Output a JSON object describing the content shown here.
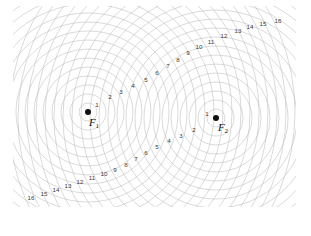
{
  "figure": {
    "background_color": "#ffffff",
    "curve_color": "#b9b9b9",
    "curve_width": 0.55,
    "label_color": "#3a3a3a",
    "dot_color": "#111111",
    "width": 311,
    "height": 236
  },
  "foci": [
    {
      "id": "F1",
      "label": "F",
      "subscript": "1",
      "x": 88,
      "y": 112,
      "ring_label": "1",
      "ring_label_x": 97,
      "ring_label_y": 105,
      "text_x": 94,
      "text_y": 122
    },
    {
      "id": "F2",
      "label": "F",
      "subscript": "2",
      "x": 216,
      "y": 118,
      "ring_label": "1",
      "ring_label_x": 207,
      "ring_label_y": 114,
      "text_x": 223,
      "text_y": 127
    }
  ],
  "circle_family_1": {
    "center_x": 88,
    "center_y": 112,
    "radii": [
      9,
      18,
      27,
      36,
      45,
      54,
      63,
      72,
      81,
      90,
      99,
      108,
      117,
      126,
      135,
      144,
      153,
      162,
      171,
      180,
      189,
      198,
      207
    ]
  },
  "circle_family_2": {
    "center_x": 216,
    "center_y": 118,
    "radii": [
      9,
      18,
      27,
      36,
      45,
      54,
      63,
      72,
      81,
      90,
      99,
      108,
      117,
      126,
      135,
      144,
      153,
      162,
      171,
      180,
      189,
      198,
      207
    ]
  },
  "upper_branch_labels": [
    {
      "text": "2",
      "x": 110,
      "y": 97
    },
    {
      "text": "3",
      "x": 121,
      "y": 92
    },
    {
      "text": "4",
      "x": 133,
      "y": 86
    },
    {
      "text": "5",
      "x": 146,
      "y": 80
    },
    {
      "text": "6",
      "x": 157,
      "y": 73
    },
    {
      "text": "7",
      "x": 168,
      "y": 66
    },
    {
      "text": "8",
      "x": 178,
      "y": 60
    },
    {
      "text": "9",
      "x": 188,
      "y": 53
    },
    {
      "text": "10",
      "x": 199,
      "y": 47
    },
    {
      "text": "11",
      "x": 211,
      "y": 42
    },
    {
      "text": "12",
      "x": 224,
      "y": 36
    },
    {
      "text": "13",
      "x": 238,
      "y": 31
    },
    {
      "text": "14",
      "x": 250,
      "y": 27
    },
    {
      "text": "15",
      "x": 263,
      "y": 24
    },
    {
      "text": "16",
      "x": 278,
      "y": 21
    }
  ],
  "lower_branch_labels": [
    {
      "text": "2",
      "x": 194,
      "y": 130
    },
    {
      "text": "3",
      "x": 181,
      "y": 136
    },
    {
      "text": "4",
      "x": 169,
      "y": 141
    },
    {
      "text": "5",
      "x": 157,
      "y": 147
    },
    {
      "text": "6",
      "x": 146,
      "y": 153
    },
    {
      "text": "7",
      "x": 136,
      "y": 159
    },
    {
      "text": "8",
      "x": 126,
      "y": 165
    },
    {
      "text": "9",
      "x": 115,
      "y": 170
    },
    {
      "text": "10",
      "x": 104,
      "y": 174
    },
    {
      "text": "11",
      "x": 92,
      "y": 178
    },
    {
      "text": "12",
      "x": 80,
      "y": 182
    },
    {
      "text": "13",
      "x": 68,
      "y": 186
    },
    {
      "text": "14",
      "x": 56,
      "y": 190
    },
    {
      "text": "15",
      "x": 44,
      "y": 194
    },
    {
      "text": "16",
      "x": 31,
      "y": 198
    }
  ]
}
